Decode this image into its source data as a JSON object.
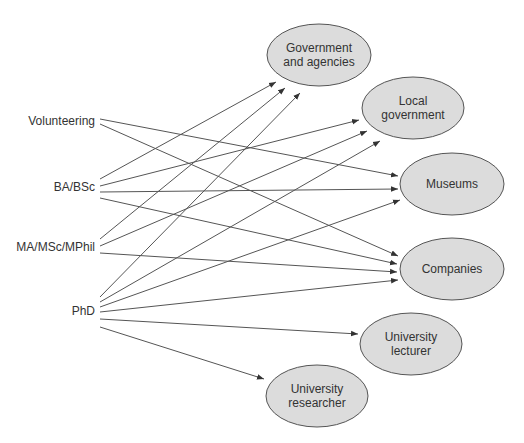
{
  "colors": {
    "line": "#555555",
    "node_fill": "#dcdcdc",
    "node_stroke": "#555555",
    "text": "#333333"
  },
  "sources": [
    {
      "id": "volunteering",
      "label": "Volunteering",
      "x": 95,
      "y": 122
    },
    {
      "id": "ba",
      "label": "BA/BSc",
      "x": 95,
      "y": 188
    },
    {
      "id": "ma",
      "label": "MA/MSc/MPhil",
      "x": 95,
      "y": 248
    },
    {
      "id": "phd",
      "label": "PhD",
      "x": 95,
      "y": 312
    }
  ],
  "targets": [
    {
      "id": "gov",
      "lines": [
        "Government",
        "and agencies"
      ],
      "cx": 319,
      "cy": 55,
      "rx": 52,
      "ry": 31
    },
    {
      "id": "local",
      "lines": [
        "Local",
        "government"
      ],
      "cx": 413,
      "cy": 108,
      "rx": 51,
      "ry": 31
    },
    {
      "id": "museums",
      "lines": [
        "Museums"
      ],
      "cx": 452,
      "cy": 184,
      "rx": 52,
      "ry": 31
    },
    {
      "id": "companies",
      "lines": [
        "Companies"
      ],
      "cx": 452,
      "cy": 269,
      "rx": 52,
      "ry": 31
    },
    {
      "id": "lecturer",
      "lines": [
        "University",
        "lecturer"
      ],
      "cx": 411,
      "cy": 344,
      "rx": 51,
      "ry": 31
    },
    {
      "id": "researcher",
      "lines": [
        "University",
        "researcher"
      ],
      "cx": 317,
      "cy": 396,
      "rx": 51,
      "ry": 31
    }
  ],
  "edges": [
    {
      "from": "volunteering",
      "to": "museums",
      "x1": 100,
      "y1": 119,
      "x2": 398,
      "y2": 176
    },
    {
      "from": "volunteering",
      "to": "companies",
      "x1": 100,
      "y1": 124,
      "x2": 398,
      "y2": 256
    },
    {
      "from": "ba",
      "to": "gov",
      "x1": 100,
      "y1": 179,
      "x2": 276,
      "y2": 82
    },
    {
      "from": "ba",
      "to": "local",
      "x1": 100,
      "y1": 186,
      "x2": 359,
      "y2": 120
    },
    {
      "from": "ba",
      "to": "museums",
      "x1": 100,
      "y1": 192,
      "x2": 398,
      "y2": 189
    },
    {
      "from": "ba",
      "to": "companies",
      "x1": 100,
      "y1": 198,
      "x2": 397,
      "y2": 264
    },
    {
      "from": "ma",
      "to": "gov",
      "x1": 100,
      "y1": 239,
      "x2": 285,
      "y2": 88
    },
    {
      "from": "ma",
      "to": "local",
      "x1": 100,
      "y1": 246,
      "x2": 367,
      "y2": 131
    },
    {
      "from": "ma",
      "to": "companies",
      "x1": 100,
      "y1": 253,
      "x2": 397,
      "y2": 272
    },
    {
      "from": "phd",
      "to": "gov",
      "x1": 100,
      "y1": 297,
      "x2": 300,
      "y2": 93
    },
    {
      "from": "phd",
      "to": "local",
      "x1": 100,
      "y1": 302,
      "x2": 380,
      "y2": 141
    },
    {
      "from": "phd",
      "to": "museums",
      "x1": 100,
      "y1": 307,
      "x2": 400,
      "y2": 200
    },
    {
      "from": "phd",
      "to": "companies",
      "x1": 100,
      "y1": 312,
      "x2": 398,
      "y2": 280
    },
    {
      "from": "phd",
      "to": "lecturer",
      "x1": 100,
      "y1": 319,
      "x2": 358,
      "y2": 334
    },
    {
      "from": "phd",
      "to": "researcher",
      "x1": 100,
      "y1": 327,
      "x2": 264,
      "y2": 379
    }
  ]
}
